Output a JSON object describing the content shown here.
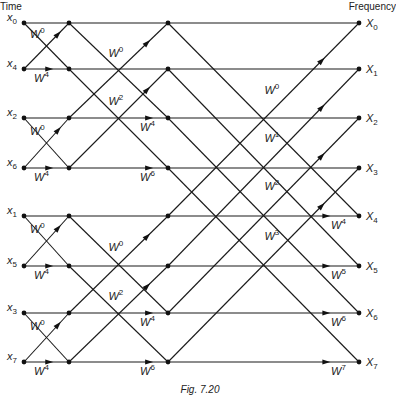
{
  "headers": {
    "left": "Time",
    "right": "Frequency"
  },
  "caption": "Fig. 7.20",
  "columns_x": [
    24,
    69,
    168,
    359
  ],
  "rows_y": [
    23,
    69,
    118,
    168,
    216,
    266,
    313,
    362
  ],
  "inputs": [
    {
      "sym": "x",
      "sub": "0"
    },
    {
      "sym": "x",
      "sub": "4"
    },
    {
      "sym": "x",
      "sub": "2"
    },
    {
      "sym": "x",
      "sub": "6"
    },
    {
      "sym": "x",
      "sub": "1"
    },
    {
      "sym": "x",
      "sub": "5"
    },
    {
      "sym": "x",
      "sub": "3"
    },
    {
      "sym": "x",
      "sub": "7"
    }
  ],
  "outputs": [
    {
      "sym": "X",
      "sub": "0"
    },
    {
      "sym": "X",
      "sub": "1"
    },
    {
      "sym": "X",
      "sub": "2"
    },
    {
      "sym": "X",
      "sub": "3"
    },
    {
      "sym": "X",
      "sub": "4"
    },
    {
      "sym": "X",
      "sub": "5"
    },
    {
      "sym": "X",
      "sub": "6"
    },
    {
      "sym": "X",
      "sub": "7"
    }
  ],
  "stage1": {
    "span": 1,
    "twiddles": [
      {
        "row": 0,
        "diag": "W",
        "exp": "0"
      },
      {
        "row": 1,
        "horiz": "W",
        "exp": "4"
      },
      {
        "row": 2,
        "diag": "W",
        "exp": "0"
      },
      {
        "row": 3,
        "horiz": "W",
        "exp": "4"
      },
      {
        "row": 4,
        "diag": "W",
        "exp": "0"
      },
      {
        "row": 5,
        "horiz": "W",
        "exp": "4"
      },
      {
        "row": 6,
        "diag": "W",
        "exp": "0"
      },
      {
        "row": 7,
        "horiz": "W",
        "exp": "4"
      }
    ]
  },
  "stage2": {
    "span": 2,
    "twiddles": [
      {
        "row": 0,
        "type": "diag",
        "exp": "0"
      },
      {
        "row": 1,
        "type": "diag",
        "exp": "2"
      },
      {
        "row": 2,
        "type": "horiz",
        "exp": "4"
      },
      {
        "row": 3,
        "type": "horiz",
        "exp": "6"
      },
      {
        "row": 4,
        "type": "diag",
        "exp": "0"
      },
      {
        "row": 5,
        "type": "diag",
        "exp": "2"
      },
      {
        "row": 6,
        "type": "horiz",
        "exp": "4"
      },
      {
        "row": 7,
        "type": "horiz",
        "exp": "6"
      }
    ]
  },
  "stage3": {
    "span": 4,
    "twiddles": [
      {
        "row": 0,
        "type": "diag",
        "exp": "0"
      },
      {
        "row": 1,
        "type": "diag",
        "exp": "1"
      },
      {
        "row": 2,
        "type": "diag",
        "exp": "2"
      },
      {
        "row": 3,
        "type": "diag",
        "exp": "3"
      },
      {
        "row": 4,
        "type": "horiz",
        "exp": "4"
      },
      {
        "row": 5,
        "type": "horiz",
        "exp": "5"
      },
      {
        "row": 6,
        "type": "horiz",
        "exp": "6"
      },
      {
        "row": 7,
        "type": "horiz",
        "exp": "7"
      }
    ]
  },
  "colors": {
    "line": "#1a1a1a",
    "text": "#222222",
    "background": "#ffffff"
  }
}
